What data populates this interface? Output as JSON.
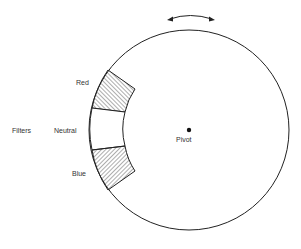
{
  "diagram": {
    "labels": {
      "filters": "Filters",
      "red": "Red",
      "neutral": "Neutral",
      "blue": "Blue",
      "pivot": "Pivot"
    },
    "rotation_arrow": "double-headed curved arrow",
    "filters": [
      {
        "name": "Red",
        "hatch": "diagonal-up"
      },
      {
        "name": "Neutral",
        "hatch": "none"
      },
      {
        "name": "Blue",
        "hatch": "diagonal-down"
      }
    ],
    "colors": {
      "stroke": "#222222",
      "background": "#ffffff",
      "text": "#333333"
    }
  }
}
